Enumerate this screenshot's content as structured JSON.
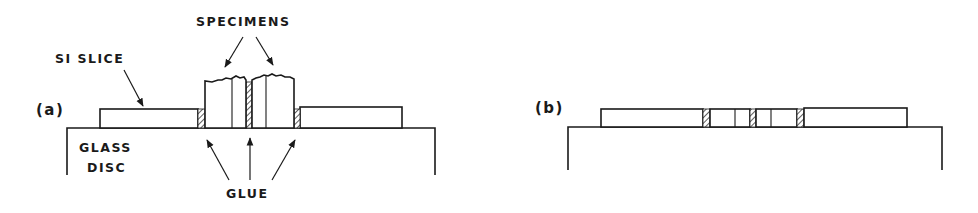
{
  "figure": {
    "panels": [
      {
        "id": "a",
        "label": "(a)",
        "annotations": {
          "specimens": "SPECIMENS",
          "si_slice": "SI SLICE",
          "glass_disc_line1": "GLASS",
          "glass_disc_line2": "DISC",
          "glue": "GLUE"
        }
      },
      {
        "id": "b",
        "label": "(b)"
      }
    ],
    "colors": {
      "ink": "#1a1a1a",
      "background": "#ffffff"
    }
  }
}
